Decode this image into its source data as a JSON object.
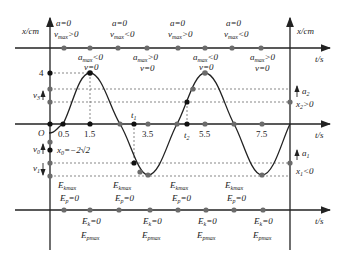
{
  "diagram": {
    "axes": {
      "y_label": "x/cm",
      "x_label": "t/s",
      "origin": "O",
      "y_tick": "4",
      "x_ticks": [
        "0.5",
        "1.5",
        "3.5",
        "5.5",
        "7.5"
      ],
      "time_marks": [
        "t1",
        "t2"
      ]
    },
    "top_row": {
      "above": [
        {
          "line1": "a=0",
          "line2": "v",
          "sub": "max",
          "rel": ">0"
        },
        {
          "line1": "a=0",
          "line2": "v",
          "sub": "max",
          "rel": "<0"
        },
        {
          "line1": "a=0",
          "line2": "v",
          "sub": "max",
          "rel": ">0"
        },
        {
          "line1": "a=0",
          "line2": "v",
          "sub": "max",
          "rel": "<0"
        }
      ],
      "below": [
        {
          "line1": "a",
          "sub": "max",
          "rel": "<0",
          "line2": "v=0"
        },
        {
          "line1": "a",
          "sub": "max",
          "rel": ">0",
          "line2": "v=0"
        },
        {
          "line1": "a",
          "sub": "max",
          "rel": "<0",
          "line2": "v=0"
        },
        {
          "line1": "a",
          "sub": "max",
          "rel": ">0",
          "line2": "v=0"
        }
      ]
    },
    "left_labels": {
      "v3": "v",
      "v3_sub": "3",
      "v0": "v",
      "v0_sub": "0",
      "v1": "v",
      "v1_sub": "1",
      "x0": "x₀=−2√2"
    },
    "right_labels": {
      "a2": "a",
      "a2_sub": "2",
      "x2": "x₂>0",
      "a1": "a",
      "a1_sub": "1",
      "x1": "x₁<0"
    },
    "bottom_row": {
      "above": [
        {
          "line1": "E",
          "sub1": "kmax",
          "line2": "E",
          "sub2": "p",
          "rel2": "=0"
        },
        {
          "line1": "E",
          "sub1": "kmax",
          "line2": "E",
          "sub2": "p",
          "rel2": "=0"
        },
        {
          "line1": "E",
          "sub1": "kmax",
          "line2": "E",
          "sub2": "p",
          "rel2": "=0"
        },
        {
          "line1": "E",
          "sub1": "kmax",
          "line2": "E",
          "sub2": "p",
          "rel2": "=0"
        }
      ],
      "below": [
        {
          "line1": "E",
          "sub1": "k",
          "rel1": "=0",
          "line2": "E",
          "sub2": "pmax"
        },
        {
          "line1": "E",
          "sub1": "k",
          "rel1": "=0",
          "line2": "E",
          "sub2": "pmax"
        },
        {
          "line1": "E",
          "sub1": "k",
          "rel1": "=0",
          "line2": "E",
          "sub2": "pmax"
        },
        {
          "line1": "E",
          "sub1": "k",
          "rel1": "=0",
          "line2": "E",
          "sub2": "pmax"
        }
      ]
    },
    "colors": {
      "line": "#222222",
      "point_gray": "#6b6b6b",
      "point_black": "#111111",
      "dashed": "#555555"
    },
    "curve": {
      "amplitude_cm": 4,
      "period_s": 4,
      "phase_start_s": 0.5,
      "t_range": [
        0,
        8
      ]
    }
  }
}
